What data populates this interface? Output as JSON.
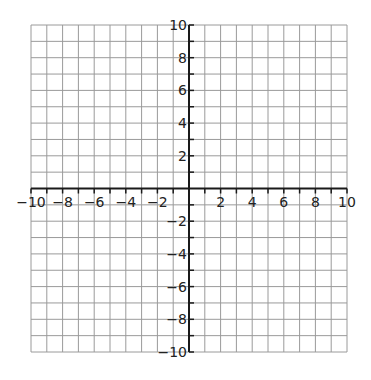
{
  "chart_data": {
    "type": "scatter",
    "title": "",
    "xlabel": "",
    "ylabel": "",
    "xlim": [
      -10,
      10
    ],
    "ylim": [
      -10,
      10
    ],
    "grid": true,
    "grid_step": 1,
    "x_ticks": [
      -10,
      -8,
      -6,
      -4,
      -2,
      2,
      4,
      6,
      8,
      10
    ],
    "y_ticks": [
      10,
      8,
      6,
      4,
      2,
      -2,
      -4,
      -6,
      -8,
      -10
    ],
    "x_tick_labels": [
      "−10",
      "−8",
      "−6",
      "−4",
      "−2",
      "2",
      "4",
      "6",
      "8",
      "10"
    ],
    "y_tick_labels": [
      "10",
      "8",
      "6",
      "4",
      "2",
      "−2",
      "−4",
      "−6",
      "−8",
      "−10"
    ],
    "series": [],
    "legend": null
  },
  "colors": {
    "grid": "#9a9a9a",
    "axis": "#1a1a1a",
    "background": "#ffffff"
  }
}
